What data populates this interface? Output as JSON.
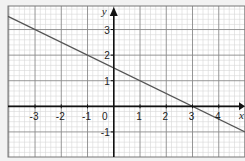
{
  "chart_data": {
    "type": "line",
    "title": "",
    "xlabel": "x",
    "ylabel": "y",
    "xlim": [
      -4.03,
      5.0
    ],
    "ylim": [
      -1.98,
      3.92
    ],
    "grid": true,
    "minor_grid_subdivisions": 5,
    "x_ticks": [
      -3,
      -2,
      -1,
      0,
      1,
      2,
      3,
      4
    ],
    "x_tick_labels": [
      "-3",
      "-2",
      "-1",
      "0",
      "1",
      "2",
      "3",
      "4"
    ],
    "y_ticks": [
      -1,
      1,
      2,
      3
    ],
    "y_tick_labels": [
      "-1",
      "1",
      "2",
      "3"
    ],
    "series": [
      {
        "name": "line",
        "equation": "y = -0.5x + 1.5",
        "slope": -0.5,
        "intercept": 1.5,
        "x": [
          -4.03,
          5.0
        ],
        "y": [
          3.515,
          -1.0
        ],
        "color": "#555555"
      }
    ],
    "colors": {
      "background": "#f2f2f2",
      "paper": "#ffffff",
      "minor_grid": "#d6d6d6",
      "major_grid": "#8a8a8a",
      "axis": "#111111"
    }
  }
}
